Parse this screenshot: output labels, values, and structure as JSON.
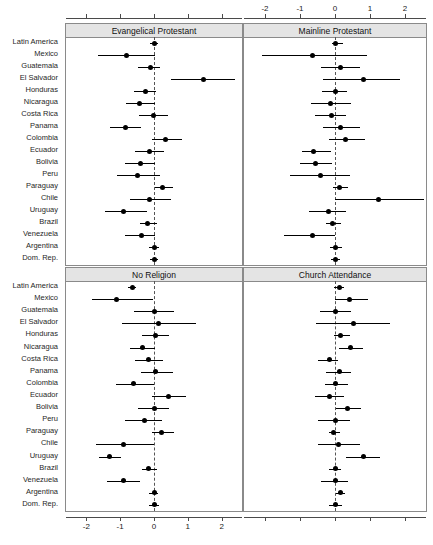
{
  "figure": {
    "type": "forest-plot-grid",
    "width": 433,
    "height": 545,
    "background": "#ffffff",
    "reference_line_value": 0,
    "reference_line_style": "dashed",
    "point_color": "#000000",
    "strip_background": "#e4e4e4"
  },
  "countries": [
    "Latin America",
    "Mexico",
    "Guatemala",
    "El Salvador",
    "Honduras",
    "Nicaragua",
    "Costa Rica",
    "Panama",
    "Colombia",
    "Ecuador",
    "Bolivia",
    "Peru",
    "Paraguay",
    "Chile",
    "Uruguay",
    "Brazil",
    "Venezuela",
    "Argentina",
    "Dom. Rep."
  ],
  "axis": {
    "ticks": [
      -2,
      -1,
      0,
      1,
      2
    ],
    "tick_labels": [
      "-2",
      "-1",
      "0",
      "1",
      "2"
    ],
    "min": -2.6,
    "max": 2.6,
    "top_axis_panel": "Mainline Protestant",
    "bottom_axis_panel": "No Religion"
  },
  "chart_data": {
    "type": "scatter",
    "title": "",
    "xlabel": "",
    "ylabel": "",
    "xlim": [
      -2.6,
      2.6
    ],
    "grid": false,
    "legend": "none",
    "categories": [
      "Latin America",
      "Mexico",
      "Guatemala",
      "El Salvador",
      "Honduras",
      "Nicaragua",
      "Costa Rica",
      "Panama",
      "Colombia",
      "Ecuador",
      "Bolivia",
      "Peru",
      "Paraguay",
      "Chile",
      "Uruguay",
      "Brazil",
      "Venezuela",
      "Argentina",
      "Dom. Rep."
    ],
    "panels": [
      {
        "title": "Evangelical Protestant",
        "position": "top-left",
        "points": [
          {
            "category": "Latin America",
            "estimate": 0.0,
            "low": -0.13,
            "high": 0.12
          },
          {
            "category": "Mexico",
            "estimate": -0.8,
            "low": -1.66,
            "high": 0.04
          },
          {
            "category": "Guatemala",
            "estimate": -0.1,
            "low": -0.48,
            "high": 0.18
          },
          {
            "category": "El Salvador",
            "estimate": 1.45,
            "low": 0.5,
            "high": 2.4
          },
          {
            "category": "Honduras",
            "estimate": -0.25,
            "low": -0.6,
            "high": 0.07
          },
          {
            "category": "Nicaragua",
            "estimate": -0.42,
            "low": -0.82,
            "high": 0.02
          },
          {
            "category": "Costa Rica",
            "estimate": -0.02,
            "low": -0.45,
            "high": 0.42
          },
          {
            "category": "Panama",
            "estimate": -0.85,
            "low": -1.3,
            "high": -0.38
          },
          {
            "category": "Colombia",
            "estimate": 0.33,
            "low": -0.05,
            "high": 0.82
          },
          {
            "category": "Ecuador",
            "estimate": -0.12,
            "low": -0.56,
            "high": 0.3
          },
          {
            "category": "Bolivia",
            "estimate": -0.4,
            "low": -0.86,
            "high": 0.02
          },
          {
            "category": "Peru",
            "estimate": -0.48,
            "low": -1.1,
            "high": 0.17
          },
          {
            "category": "Paraguay",
            "estimate": 0.26,
            "low": 0.02,
            "high": 0.56
          },
          {
            "category": "Chile",
            "estimate": -0.13,
            "low": -0.72,
            "high": 0.5
          },
          {
            "category": "Uruguay",
            "estimate": -0.9,
            "low": -1.45,
            "high": -0.2
          },
          {
            "category": "Brazil",
            "estimate": -0.2,
            "low": -0.42,
            "high": 0.1
          },
          {
            "category": "Venezuela",
            "estimate": -0.37,
            "low": -0.86,
            "high": 0.03
          },
          {
            "category": "Argentina",
            "estimate": 0.0,
            "low": -0.14,
            "high": 0.14
          },
          {
            "category": "Dom. Rep.",
            "estimate": 0.0,
            "low": -0.12,
            "high": 0.12
          }
        ]
      },
      {
        "title": "Mainline Protestant",
        "position": "top-right",
        "points": [
          {
            "category": "Latin America",
            "estimate": 0.0,
            "low": -0.1,
            "high": 0.22
          },
          {
            "category": "Mexico",
            "estimate": -0.65,
            "low": -2.1,
            "high": 0.92
          },
          {
            "category": "Guatemala",
            "estimate": 0.15,
            "low": -0.4,
            "high": 0.7
          },
          {
            "category": "El Salvador",
            "estimate": 0.8,
            "low": -0.35,
            "high": 1.85
          },
          {
            "category": "Honduras",
            "estimate": 0.0,
            "low": -0.38,
            "high": 0.35
          },
          {
            "category": "Nicaragua",
            "estimate": -0.13,
            "low": -0.68,
            "high": 0.45
          },
          {
            "category": "Costa Rica",
            "estimate": -0.1,
            "low": -0.56,
            "high": 0.32
          },
          {
            "category": "Panama",
            "estimate": 0.15,
            "low": -0.33,
            "high": 0.72
          },
          {
            "category": "Colombia",
            "estimate": 0.3,
            "low": -0.18,
            "high": 0.86
          },
          {
            "category": "Ecuador",
            "estimate": -0.62,
            "low": -0.94,
            "high": -0.1
          },
          {
            "category": "Bolivia",
            "estimate": -0.55,
            "low": -1.0,
            "high": -0.1
          },
          {
            "category": "Peru",
            "estimate": -0.42,
            "low": -1.28,
            "high": 0.42
          },
          {
            "category": "Paraguay",
            "estimate": 0.12,
            "low": -0.06,
            "high": 0.38
          },
          {
            "category": "Chile",
            "estimate": 1.25,
            "low": 0.0,
            "high": 2.55
          },
          {
            "category": "Uruguay",
            "estimate": -0.2,
            "low": -0.75,
            "high": 0.32
          },
          {
            "category": "Brazil",
            "estimate": -0.07,
            "low": -0.25,
            "high": 0.16
          },
          {
            "category": "Venezuela",
            "estimate": -0.65,
            "low": -1.45,
            "high": 0.0
          },
          {
            "category": "Argentina",
            "estimate": 0.0,
            "low": -0.14,
            "high": 0.2
          },
          {
            "category": "Dom. Rep.",
            "estimate": 0.0,
            "low": -0.12,
            "high": 0.14
          }
        ]
      },
      {
        "title": "No Religion",
        "position": "bottom-left",
        "points": [
          {
            "category": "Latin America",
            "estimate": -0.65,
            "low": -0.78,
            "high": -0.52
          },
          {
            "category": "Mexico",
            "estimate": -1.12,
            "low": -1.84,
            "high": -0.02
          },
          {
            "category": "Guatemala",
            "estimate": 0.0,
            "low": -0.6,
            "high": 0.58
          },
          {
            "category": "El Salvador",
            "estimate": 0.14,
            "low": -0.94,
            "high": 1.25
          },
          {
            "category": "Honduras",
            "estimate": 0.05,
            "low": -0.36,
            "high": 0.45
          },
          {
            "category": "Nicaragua",
            "estimate": -0.34,
            "low": -0.7,
            "high": 0.02
          },
          {
            "category": "Costa Rica",
            "estimate": -0.15,
            "low": -0.55,
            "high": 0.26
          },
          {
            "category": "Panama",
            "estimate": 0.05,
            "low": -0.38,
            "high": 0.55
          },
          {
            "category": "Colombia",
            "estimate": -0.6,
            "low": -1.12,
            "high": 0.0
          },
          {
            "category": "Ecuador",
            "estimate": 0.42,
            "low": -0.05,
            "high": 0.95
          },
          {
            "category": "Bolivia",
            "estimate": 0.0,
            "low": -0.46,
            "high": 0.43
          },
          {
            "category": "Peru",
            "estimate": -0.28,
            "low": -0.85,
            "high": 0.25
          },
          {
            "category": "Paraguay",
            "estimate": 0.22,
            "low": -0.05,
            "high": 0.6
          },
          {
            "category": "Chile",
            "estimate": -0.9,
            "low": -1.7,
            "high": 0.0
          },
          {
            "category": "Uruguay",
            "estimate": -1.32,
            "low": -1.62,
            "high": -0.98
          },
          {
            "category": "Brazil",
            "estimate": -0.17,
            "low": -0.34,
            "high": 0.08
          },
          {
            "category": "Venezuela",
            "estimate": -0.9,
            "low": -1.4,
            "high": -0.42
          },
          {
            "category": "Argentina",
            "estimate": 0.0,
            "low": -0.14,
            "high": 0.12
          },
          {
            "category": "Dom. Rep.",
            "estimate": 0.0,
            "low": -0.14,
            "high": 0.14
          }
        ]
      },
      {
        "title": "Church Attendance",
        "position": "bottom-right",
        "points": [
          {
            "category": "Latin America",
            "estimate": 0.12,
            "low": -0.02,
            "high": 0.26
          },
          {
            "category": "Mexico",
            "estimate": 0.42,
            "low": 0.0,
            "high": 0.95
          },
          {
            "category": "Guatemala",
            "estimate": 0.02,
            "low": -0.42,
            "high": 0.45
          },
          {
            "category": "El Salvador",
            "estimate": 0.52,
            "low": -0.55,
            "high": 1.58
          },
          {
            "category": "Honduras",
            "estimate": 0.15,
            "low": -0.04,
            "high": 0.42
          },
          {
            "category": "Nicaragua",
            "estimate": 0.45,
            "low": 0.1,
            "high": 0.8
          },
          {
            "category": "Costa Rica",
            "estimate": -0.17,
            "low": -0.5,
            "high": 0.08
          },
          {
            "category": "Panama",
            "estimate": 0.12,
            "low": -0.25,
            "high": 0.45
          },
          {
            "category": "Colombia",
            "estimate": 0.02,
            "low": -0.3,
            "high": 0.36
          },
          {
            "category": "Ecuador",
            "estimate": -0.15,
            "low": -0.56,
            "high": 0.26
          },
          {
            "category": "Bolivia",
            "estimate": 0.35,
            "low": 0.02,
            "high": 0.75
          },
          {
            "category": "Peru",
            "estimate": 0.0,
            "low": -0.48,
            "high": 0.42
          },
          {
            "category": "Paraguay",
            "estimate": -0.05,
            "low": -0.18,
            "high": 0.14
          },
          {
            "category": "Chile",
            "estimate": 0.1,
            "low": -0.5,
            "high": 0.7
          },
          {
            "category": "Uruguay",
            "estimate": 0.8,
            "low": 0.32,
            "high": 1.28
          },
          {
            "category": "Brazil",
            "estimate": 0.0,
            "low": -0.18,
            "high": 0.18
          },
          {
            "category": "Venezuela",
            "estimate": 0.0,
            "low": -0.4,
            "high": 0.38
          },
          {
            "category": "Argentina",
            "estimate": 0.15,
            "low": 0.02,
            "high": 0.3
          },
          {
            "category": "Dom. Rep.",
            "estimate": 0.02,
            "low": -0.16,
            "high": 0.2
          }
        ]
      }
    ]
  }
}
